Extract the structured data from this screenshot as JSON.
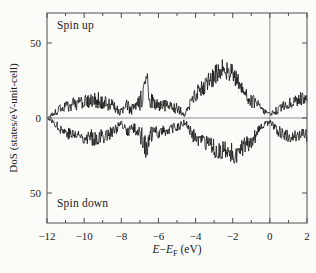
{
  "figure": {
    "spin_up_label": "Spin up",
    "spin_down_label": "Spin down",
    "ylabel": "DoS (states/eV-unit-cell)",
    "xlabel_parts": {
      "e1": "E",
      "minus": "−",
      "e2": "E",
      "sub": "F",
      "unit": "(eV)"
    }
  },
  "chart_data": {
    "type": "line",
    "title": "",
    "xlabel": "E−E_F (eV)",
    "ylabel": "DoS (states/eV-unit-cell)",
    "xlim": [
      -12,
      2
    ],
    "ylim": [
      -70,
      70
    ],
    "grid": false,
    "x_ticks": [
      -12,
      -10,
      -8,
      -6,
      -4,
      -2,
      0,
      2
    ],
    "x_tick_labels": [
      "−12",
      "−10",
      "−8",
      "−6",
      "−4",
      "−2",
      "0",
      "2"
    ],
    "y_ticks": [
      50,
      0,
      -50
    ],
    "y_tick_labels": [
      "50",
      "0",
      "50"
    ],
    "zero_line_y": 0,
    "fermi_line_x": 0,
    "annotations": [
      "Spin up",
      "Spin down"
    ],
    "series": [
      {
        "name": "Spin up",
        "seed": 20,
        "envelope": [
          [
            -12.0,
            0,
            0.4
          ],
          [
            -11.8,
            1.5,
            1.2
          ],
          [
            -11.5,
            4,
            2.5
          ],
          [
            -11.2,
            7,
            3.5
          ],
          [
            -10.7,
            9,
            4.5
          ],
          [
            -10.1,
            10,
            5
          ],
          [
            -9.6,
            11,
            5
          ],
          [
            -9.2,
            12,
            6
          ],
          [
            -8.8,
            10,
            5
          ],
          [
            -8.4,
            8,
            4
          ],
          [
            -8.05,
            3.5,
            2.5
          ],
          [
            -7.7,
            8,
            4.5
          ],
          [
            -7.45,
            6,
            4
          ],
          [
            -7.2,
            7,
            4.5
          ],
          [
            -6.95,
            11,
            7
          ],
          [
            -6.75,
            18,
            8
          ],
          [
            -6.62,
            26,
            7
          ],
          [
            -6.45,
            12,
            6
          ],
          [
            -6.2,
            9,
            5
          ],
          [
            -5.9,
            9,
            4.5
          ],
          [
            -5.5,
            8,
            4
          ],
          [
            -5.1,
            7,
            4
          ],
          [
            -4.8,
            5,
            3
          ],
          [
            -4.55,
            2,
            1.5
          ],
          [
            -4.35,
            8,
            4
          ],
          [
            -4.1,
            14,
            5
          ],
          [
            -3.8,
            18,
            5.5
          ],
          [
            -3.5,
            22,
            6
          ],
          [
            -3.2,
            26,
            6.5
          ],
          [
            -2.9,
            29,
            7
          ],
          [
            -2.6,
            32,
            7
          ],
          [
            -2.4,
            33,
            7
          ],
          [
            -2.1,
            30,
            7
          ],
          [
            -1.9,
            27,
            7
          ],
          [
            -1.6,
            22,
            6.5
          ],
          [
            -1.3,
            17,
            6
          ],
          [
            -1.0,
            12,
            5
          ],
          [
            -0.7,
            9,
            4
          ],
          [
            -0.45,
            6,
            2.5
          ],
          [
            -0.2,
            4,
            2
          ],
          [
            0.0,
            2,
            1.5
          ],
          [
            0.25,
            4,
            2.5
          ],
          [
            0.5,
            6,
            3
          ],
          [
            0.9,
            9,
            3.5
          ],
          [
            1.3,
            11,
            4
          ],
          [
            1.7,
            13,
            4.5
          ],
          [
            2.0,
            15,
            5
          ]
        ]
      },
      {
        "name": "Spin down",
        "seed": 77,
        "envelope": [
          [
            -12.0,
            0,
            0.4
          ],
          [
            -11.8,
            -1.5,
            1.2
          ],
          [
            -11.5,
            -4.5,
            2.5
          ],
          [
            -11.2,
            -8,
            3.5
          ],
          [
            -10.7,
            -11,
            4.5
          ],
          [
            -10.1,
            -12,
            5
          ],
          [
            -9.6,
            -13,
            5.5
          ],
          [
            -9.2,
            -13,
            5.5
          ],
          [
            -8.8,
            -11,
            5
          ],
          [
            -8.4,
            -9,
            4
          ],
          [
            -8.05,
            -4,
            2.5
          ],
          [
            -7.7,
            -9,
            4.5
          ],
          [
            -7.45,
            -7,
            4
          ],
          [
            -7.2,
            -8,
            4.5
          ],
          [
            -6.95,
            -11,
            7
          ],
          [
            -6.75,
            -16,
            8
          ],
          [
            -6.62,
            -24,
            7
          ],
          [
            -6.45,
            -12,
            6
          ],
          [
            -6.2,
            -10,
            5
          ],
          [
            -5.9,
            -9,
            4.5
          ],
          [
            -5.5,
            -8,
            4
          ],
          [
            -5.1,
            -7,
            4
          ],
          [
            -4.8,
            -5,
            3
          ],
          [
            -4.55,
            -2.5,
            2
          ],
          [
            -4.35,
            -8,
            4
          ],
          [
            -4.1,
            -12,
            5
          ],
          [
            -3.8,
            -15,
            5
          ],
          [
            -3.5,
            -17,
            5.5
          ],
          [
            -3.2,
            -19,
            6
          ],
          [
            -2.9,
            -21,
            6.5
          ],
          [
            -2.6,
            -22,
            7
          ],
          [
            -2.3,
            -23,
            7
          ],
          [
            -2.0,
            -24,
            7.5
          ],
          [
            -1.7,
            -23,
            7
          ],
          [
            -1.4,
            -20,
            6.5
          ],
          [
            -1.1,
            -16,
            6
          ],
          [
            -0.8,
            -12,
            5
          ],
          [
            -0.55,
            -8,
            3.5
          ],
          [
            -0.3,
            -5,
            2.5
          ],
          [
            -0.1,
            -3,
            2
          ],
          [
            0.05,
            -3,
            2
          ],
          [
            0.3,
            -7,
            3.5
          ],
          [
            0.6,
            -10,
            4
          ],
          [
            1.0,
            -12,
            4
          ],
          [
            1.4,
            -12,
            4
          ],
          [
            1.7,
            -11,
            4
          ],
          [
            2.0,
            -12,
            4.5
          ]
        ]
      }
    ]
  },
  "style": {
    "background": "#fbfbf8",
    "curve_color": "#151515",
    "frame_color": "#4e4e4e",
    "guide_color": "#8f8f8f",
    "text_color": "#1b1b1b"
  }
}
